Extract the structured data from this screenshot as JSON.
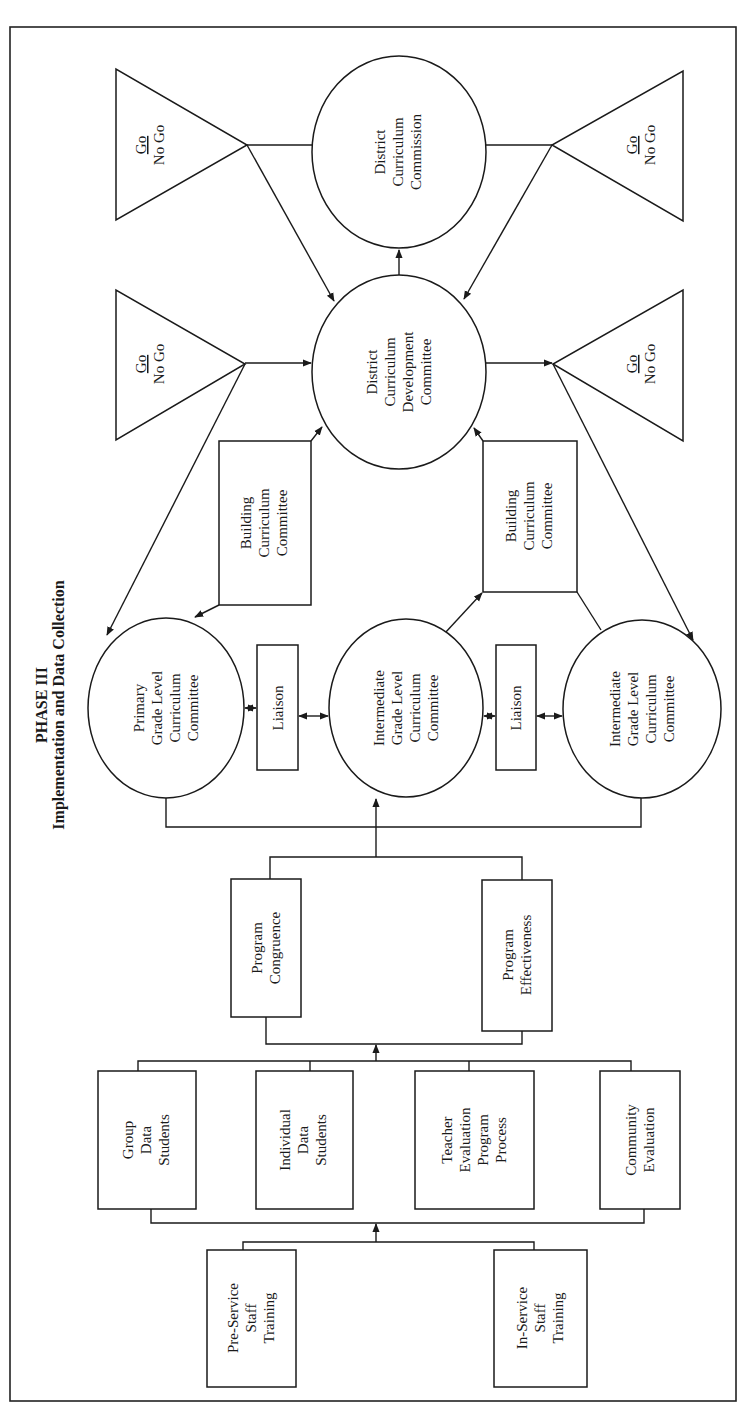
{
  "title": {
    "line1": "PHASE III",
    "line2": "Implementation and Data Collection"
  },
  "decision_gates": [
    {
      "go": "Go",
      "nogo": "No Go"
    },
    {
      "go": "Go",
      "nogo": "No Go"
    },
    {
      "go": "Go",
      "nogo": "No Go"
    },
    {
      "go": "Go",
      "nogo": "No Go"
    }
  ],
  "district_commission": {
    "lines": [
      "District",
      "Curriculum",
      "Commission"
    ]
  },
  "district_development": {
    "lines": [
      "District",
      "Curriculum",
      "Development",
      "Committee"
    ]
  },
  "building_committees": [
    {
      "lines": [
        "Building",
        "Curriculum",
        "Committee"
      ]
    },
    {
      "lines": [
        "Building",
        "Curriculum",
        "Committee"
      ]
    }
  ],
  "grade_committees": [
    {
      "lines": [
        "Primary",
        "Grade Level",
        "Curriculum",
        "Committee"
      ]
    },
    {
      "lines": [
        "Intermediate",
        "Grade Level",
        "Curriculum",
        "Committee"
      ]
    },
    {
      "lines": [
        "Intermediate",
        "Grade Level",
        "Curriculum",
        "Committee"
      ]
    }
  ],
  "liaisons": [
    {
      "label": "Liaison"
    },
    {
      "label": "Liaison"
    }
  ],
  "program_evaluation": [
    {
      "lines": [
        "Program",
        "Congruence"
      ]
    },
    {
      "lines": [
        "Program",
        "Effectiveness"
      ]
    }
  ],
  "data_sources": [
    {
      "lines": [
        "Group",
        "Data",
        "Students"
      ]
    },
    {
      "lines": [
        "Individual",
        "Data",
        "Students"
      ]
    },
    {
      "lines": [
        "Teacher",
        "Evaluation",
        "Program",
        "Process"
      ]
    },
    {
      "lines": [
        "Community",
        "Evaluation"
      ]
    }
  ],
  "staff_training": [
    {
      "lines": [
        "Pre-Service",
        "Staff",
        "Training"
      ]
    },
    {
      "lines": [
        "In-Service",
        "Staff",
        "Training"
      ]
    }
  ]
}
